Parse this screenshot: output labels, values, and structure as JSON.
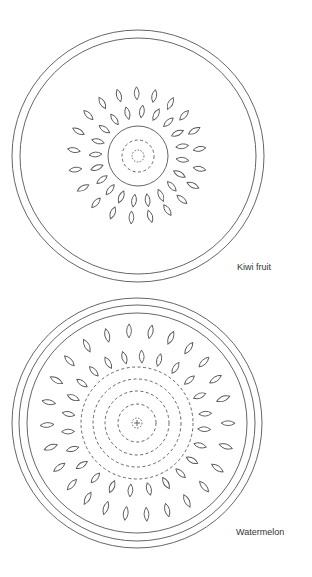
{
  "colors": {
    "background": "#ffffff",
    "stroke": "#555555",
    "label": "#333333"
  },
  "diagrams": [
    {
      "id": "kiwi",
      "label": "Kiwi fruit",
      "label_pos": [
        237,
        270
      ],
      "center": [
        138,
        156
      ],
      "solid_rings": [
        126,
        118,
        30
      ],
      "dashed_rings": [
        16,
        6
      ],
      "center_cross": false,
      "seed_rings": [
        {
          "radius": 44,
          "count": 20,
          "offset_deg": 4,
          "length": 13,
          "width": 6
        },
        {
          "radius": 63,
          "count": 21,
          "offset_deg": 12,
          "length": 13,
          "width": 6
        }
      ]
    },
    {
      "id": "watermelon",
      "label": "Watermelon",
      "label_pos": [
        236,
        535
      ],
      "center": [
        137,
        423
      ],
      "solid_rings": [
        125,
        118,
        110
      ],
      "dashed_rings": [
        56,
        44,
        32,
        19,
        5
      ],
      "center_cross": true,
      "seed_rings": [
        {
          "radius": 68,
          "count": 24,
          "offset_deg": 6,
          "length": 13,
          "width": 6
        },
        {
          "radius": 91,
          "count": 26,
          "offset_deg": 0,
          "length": 14,
          "width": 6
        }
      ]
    }
  ]
}
